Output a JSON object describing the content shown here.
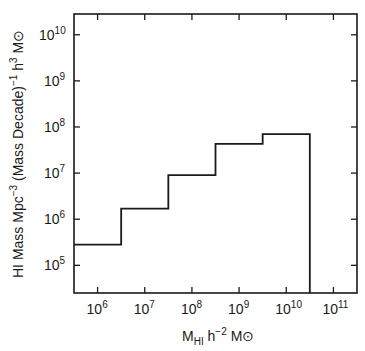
{
  "chart_data": {
    "type": "bar",
    "style": "step-histogram",
    "title": "",
    "xlabel": "M_HI h^-2 M_sun",
    "xlabel_parts": {
      "main": "M",
      "sub": "HI",
      "rest": " h",
      "sup": "−2",
      "tail": " M⊙"
    },
    "ylabel": "HI Mass Mpc^-3 (Mass Decade)^-1 h^3 M_sun",
    "ylabel_parts": {
      "a": "HI Mass Mpc",
      "a_sup": "−3",
      "b": " (Mass Decade)",
      "b_sup": "−1",
      "c": "  h",
      "c_sup": "3",
      "d": " M⊙"
    },
    "xscale": "log",
    "yscale": "log",
    "xlim_log10": [
      5.5,
      11.5
    ],
    "ylim_log10": [
      4.4,
      10.45
    ],
    "x_ticks": [
      {
        "exp": "6",
        "value": 1000000.0
      },
      {
        "exp": "7",
        "value": 10000000.0
      },
      {
        "exp": "8",
        "value": 100000000.0
      },
      {
        "exp": "9",
        "value": 1000000000.0
      },
      {
        "exp": "10",
        "value": 10000000000.0
      },
      {
        "exp": "11",
        "value": 100000000000.0
      }
    ],
    "y_ticks": [
      {
        "exp": "5",
        "value": 100000.0
      },
      {
        "exp": "6",
        "value": 1000000.0
      },
      {
        "exp": "7",
        "value": 10000000.0
      },
      {
        "exp": "8",
        "value": 100000000.0
      },
      {
        "exp": "9",
        "value": 1000000000.0
      },
      {
        "exp": "10",
        "value": 10000000000.0
      }
    ],
    "bin_edges_log10": [
      5.5,
      6.5,
      7.5,
      8.5,
      9.5,
      10.5
    ],
    "categories": [
      "10^5.5-10^6.5",
      "10^6.5-10^7.5",
      "10^7.5-10^8.5",
      "10^8.5-10^9.5",
      "10^9.5-10^10.5"
    ],
    "values": [
      280000.0,
      1700000.0,
      9000000.0,
      43000000.0,
      70000000.0
    ],
    "grid": false,
    "legend": null
  }
}
